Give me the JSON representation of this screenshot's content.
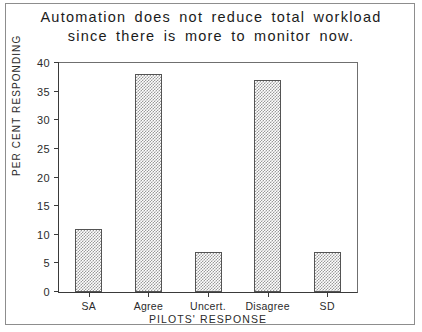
{
  "chart_data": {
    "type": "bar",
    "title": "Automation does not reduce total workload\nsince there is more to monitor now.",
    "categories": [
      "SA",
      "Agree",
      "Uncert.",
      "Disagree",
      "SD"
    ],
    "values": [
      11,
      38,
      7,
      37,
      7
    ],
    "xlabel": "PILOTS' RESPONSE",
    "ylabel": "PER CENT RESPONDING",
    "ylim": [
      0,
      40
    ],
    "ytick_labels": [
      "0",
      "5",
      "10",
      "15",
      "20",
      "25",
      "30",
      "35",
      "40"
    ],
    "ytick_values": [
      0,
      5,
      10,
      15,
      20,
      25,
      30,
      35,
      40
    ],
    "grid": false,
    "legend": null,
    "bar_fill": "#9a9a9a",
    "bar_edge": "#545454",
    "background": "#ffffff"
  }
}
